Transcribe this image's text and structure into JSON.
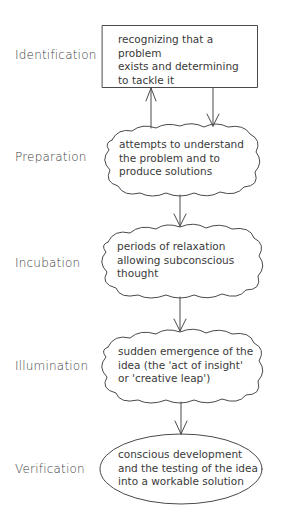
{
  "diagram": {
    "type": "flowchart",
    "stroke_color": "#4a4a4a",
    "stages": [
      {
        "label": "Identification",
        "shape": "rectangle",
        "description": "recognizing that a problem\nexists and determining\nto tackle it"
      },
      {
        "label": "Preparation",
        "shape": "cloud",
        "description": "attempts to understand\nthe problem and to\nproduce solutions"
      },
      {
        "label": "Incubation",
        "shape": "cloud",
        "description": "periods of relaxation\nallowing subconscious\nthought"
      },
      {
        "label": "Illumination",
        "shape": "cloud",
        "description": "sudden emergence of the\nidea (the 'act of insight'\nor 'creative leap')"
      },
      {
        "label": "Verification",
        "shape": "ellipse",
        "description": "conscious development\nand the testing of the idea\ninto a workable solution"
      }
    ],
    "connections": [
      {
        "from": "Identification",
        "to": "Preparation",
        "direction": "down"
      },
      {
        "from": "Preparation",
        "to": "Identification",
        "direction": "up"
      },
      {
        "from": "Preparation",
        "to": "Incubation",
        "direction": "down"
      },
      {
        "from": "Incubation",
        "to": "Illumination",
        "direction": "down"
      },
      {
        "from": "Illumination",
        "to": "Verification",
        "direction": "down"
      }
    ]
  }
}
